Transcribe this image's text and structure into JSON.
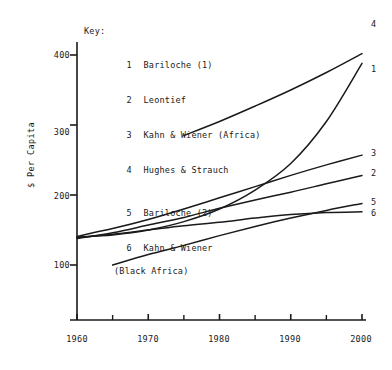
{
  "key": {
    "title": "Key:",
    "entries": [
      {
        "num": "1",
        "label": "Bariloche (1)"
      },
      {
        "num": "2",
        "label": "Leontief"
      },
      {
        "num": "3",
        "label": "Kahn & Wiener (Africa)"
      },
      {
        "num": "4",
        "label": "Hughes & Strauch"
      },
      {
        "num": "5",
        "label": "Bariloche (2)"
      },
      {
        "num": "6",
        "label": "Kahn & Wiener",
        "cont": "(Black Africa)"
      }
    ]
  },
  "axes": {
    "ylabel": "$ Per Capita",
    "yticks": [
      "400",
      "300",
      "200",
      "100"
    ],
    "xticks": [
      "1960",
      "1970",
      "1980",
      "1990",
      "2000"
    ]
  },
  "series_labels": [
    "1",
    "2",
    "3",
    "4",
    "5",
    "6"
  ],
  "colors": {
    "ink": "#1a1a1a",
    "background": "#ffffff"
  },
  "chart_data": {
    "type": "line",
    "title": "",
    "xlabel": "",
    "ylabel": "$ Per Capita",
    "xlim": [
      1960,
      2000
    ],
    "ylim": [
      60,
      410
    ],
    "grid": false,
    "legend": "inside-top-left-key-numbered",
    "xticks": [
      1960,
      1970,
      1980,
      1990,
      2000
    ],
    "xminorticks": [
      1965,
      1975,
      1985,
      1995
    ],
    "yticks": [
      100,
      200,
      300,
      400
    ],
    "series": [
      {
        "name": "Bariloche (1)",
        "key": "1",
        "x": [
          1960,
          1965,
          1970,
          1975,
          1980,
          1985,
          1990,
          1995,
          2000
        ],
        "values": [
          140,
          143,
          150,
          162,
          180,
          207,
          245,
          305,
          388
        ]
      },
      {
        "name": "Leontief",
        "key": "2",
        "x": [
          1960,
          1965,
          1970,
          1975,
          1980,
          1985,
          1990,
          1995,
          2000
        ],
        "values": [
          138,
          146,
          157,
          168,
          181,
          193,
          204,
          216,
          228
        ]
      },
      {
        "name": "Kahn & Wiener (Africa)",
        "key": "3",
        "x": [
          1960,
          1965,
          1970,
          1975,
          1980,
          1985,
          1990,
          1995,
          2000
        ],
        "values": [
          141,
          152,
          165,
          180,
          196,
          212,
          228,
          243,
          257
        ]
      },
      {
        "name": "Hughes & Strauch",
        "key": "4",
        "x": [
          1975,
          1980,
          1985,
          1990,
          1995,
          2000
        ],
        "values": [
          285,
          305,
          327,
          350,
          375,
          402
        ]
      },
      {
        "name": "Bariloche (2)",
        "key": "5",
        "x": [
          1965,
          1970,
          1975,
          1980,
          1985,
          1990,
          1995,
          2000
        ],
        "values": [
          100,
          115,
          128,
          142,
          155,
          167,
          178,
          188
        ]
      },
      {
        "name": "Kahn & Wiener (Black Africa)",
        "key": "6",
        "x": [
          1960,
          1965,
          1970,
          1975,
          1980,
          1985,
          1990,
          1995,
          2000
        ],
        "values": [
          139,
          144,
          150,
          156,
          161,
          167,
          172,
          175,
          176
        ]
      }
    ]
  }
}
